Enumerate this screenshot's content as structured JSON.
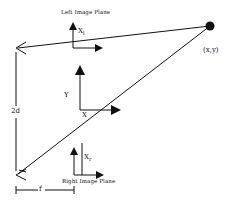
{
  "diagram": {
    "labels": {
      "left_plane": "Left Image Plane",
      "right_plane": "Right Image Plane",
      "left_axis_base": "X",
      "left_axis_sub": "l",
      "right_axis_base": "X",
      "right_axis_sub": "r",
      "world_y": "Y",
      "world_x": "X",
      "point": "(x,y)",
      "baseline": "2d",
      "focal": "f"
    },
    "colors": {
      "stroke": "#111111",
      "background": "#ffffff"
    },
    "nodes": [
      {
        "id": "left-camera",
        "x": 16,
        "y": 48
      },
      {
        "id": "right-camera",
        "x": 16,
        "y": 175
      },
      {
        "id": "world-point",
        "x": 210,
        "y": 27
      }
    ]
  }
}
